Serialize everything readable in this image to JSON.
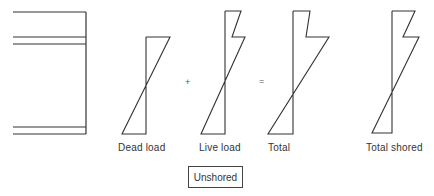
{
  "diagram": {
    "type": "stress-distribution",
    "stroke_color": "#333333",
    "section": {
      "horizontal_lines_y": [
        12,
        37,
        44,
        127,
        134
      ],
      "x_left": 13,
      "x_right": 86
    },
    "operators": {
      "plus": "+",
      "equals": "="
    },
    "distributions": [
      {
        "id": "dead-load",
        "label": "Dead load",
        "axis_x": 146,
        "points": "146,37 170,37 122,134 146,134 146,37"
      },
      {
        "id": "live-load",
        "label": "Live load",
        "axis_x": 225,
        "points": "225,11 241,11 232,37 245,37 201,134 225,134 225,11"
      },
      {
        "id": "total",
        "label": "Total",
        "axis_x": 293,
        "points": "293,11 310,11 306,37 329,37 268,134 293,134 293,11"
      },
      {
        "id": "total-shored",
        "label": "Total shored",
        "axis_x": 392,
        "points": "392,11 415,11 403,37 419,37 372,133 392,133 392,11"
      }
    ],
    "caption_box": "Unshored"
  }
}
